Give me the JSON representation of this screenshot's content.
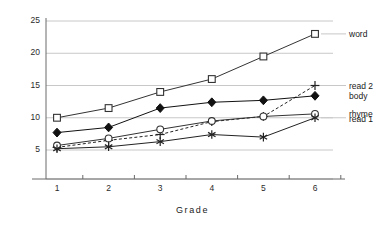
{
  "chart_data": {
    "type": "line",
    "title": "",
    "xlabel": "Grade",
    "ylabel": "",
    "x": [
      1,
      2,
      3,
      4,
      5,
      6
    ],
    "categories": [
      "1",
      "2",
      "3",
      "4",
      "5",
      "6"
    ],
    "xtick_labels": [
      "1",
      "2",
      "3",
      "4",
      "5",
      "6"
    ],
    "ytick_labels": [
      "5",
      "10",
      "15",
      "20",
      "25"
    ],
    "ytick_values": [
      5,
      10,
      15,
      20,
      25
    ],
    "ylim": [
      2.5,
      26.5
    ],
    "xlim": [
      0.55,
      6.55
    ],
    "grid": "horizontal",
    "legend_position": "right",
    "series": [
      {
        "name": "word",
        "marker": "open-square",
        "line": "solid",
        "color": "#333333",
        "values": [
          10.0,
          11.5,
          14.0,
          16.0,
          19.5,
          23.0
        ]
      },
      {
        "name": "read 2",
        "marker": "plus",
        "line": "dashed",
        "color": "#222222",
        "values": [
          5.4,
          6.5,
          7.4,
          9.4,
          10.2,
          15.0
        ]
      },
      {
        "name": "body",
        "marker": "filled-diamond",
        "line": "solid",
        "color": "#111111",
        "values": [
          7.7,
          8.5,
          11.5,
          12.4,
          12.7,
          13.4
        ]
      },
      {
        "name": "rhyme",
        "marker": "open-circle",
        "line": "solid",
        "color": "#333333",
        "values": [
          5.7,
          6.8,
          8.2,
          9.5,
          10.2,
          10.6
        ]
      },
      {
        "name": "read 1",
        "marker": "asterisk",
        "line": "solid",
        "color": "#222222",
        "values": [
          5.2,
          5.5,
          6.3,
          7.4,
          7.0,
          10.0
        ]
      }
    ]
  },
  "legend": {
    "entries": [
      {
        "label": "word"
      },
      {
        "label": "read 2"
      },
      {
        "label": "body"
      },
      {
        "label": "rhyme"
      },
      {
        "label": "read 1"
      }
    ]
  },
  "axis": {
    "x_title": "Grade"
  },
  "colors": {
    "grid": "#c8c8c8",
    "axis": "#6a6a6a",
    "text": "#1a1a1a",
    "background": "#ffffff"
  }
}
